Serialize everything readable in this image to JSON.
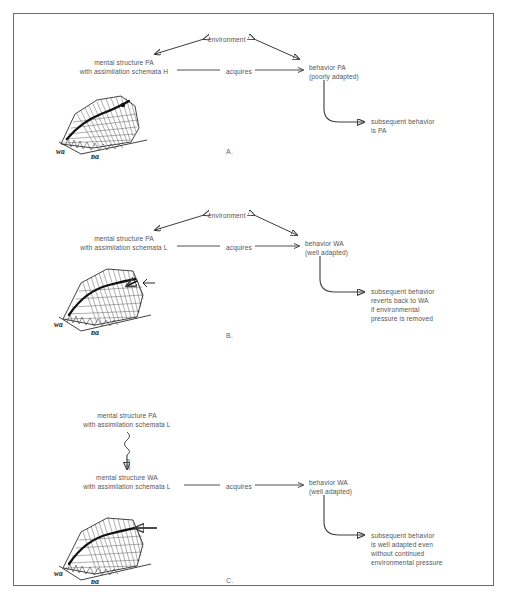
{
  "figure": {
    "type": "diagram"
  },
  "labels": {
    "environment": "environment",
    "acquires": "acquires",
    "aha": "aha!",
    "landscape_wa": "wa",
    "landscape_pa": "pa"
  },
  "panels": [
    {
      "letter": "A.",
      "mental_structure_line1": "mental structure PA",
      "mental_structure_line2": "with assimilation schemata H",
      "behavior_line1": "behavior PA",
      "behavior_line2": "(poorly adapted)",
      "subsequent_line1": "subsequent behavior",
      "subsequent_line2": "is PA",
      "subsequent_line3": "",
      "subsequent_line4": ""
    },
    {
      "letter": "B.",
      "mental_structure_line1": "mental structure PA",
      "mental_structure_line2": "with assimilation schemata L",
      "behavior_line1": "behavior WA",
      "behavior_line2": "(well adapted)",
      "subsequent_line1": "subsequent behavior",
      "subsequent_line2": "reverts back to WA",
      "subsequent_line3": "if environmental",
      "subsequent_line4": "pressure is removed"
    },
    {
      "letter": "C.",
      "mental_structure_line1": "mental structure PA",
      "mental_structure_line2": "with assimilation schemata L",
      "mental_structure2_line1": "mental structure WA",
      "mental_structure2_line2": "with assimilation schemata L",
      "behavior_line1": "behavior WA",
      "behavior_line2": "(well adapted)",
      "subsequent_line1": "subsequent behavior",
      "subsequent_line2": "is well adapted even",
      "subsequent_line3": "without continued",
      "subsequent_line4": "environmental pressure"
    }
  ],
  "colors": {
    "ink": "#3c3c3c",
    "text": "#555555",
    "frame": "#6b6b6b",
    "background": "#ffffff"
  }
}
